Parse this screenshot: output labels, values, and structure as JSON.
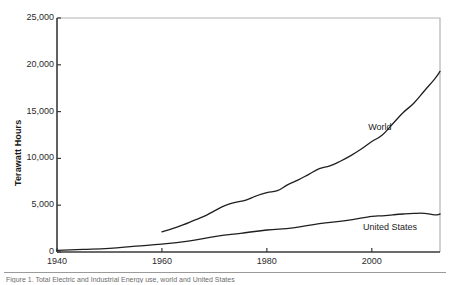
{
  "chart_data": {
    "type": "line",
    "title": "",
    "xlabel": "",
    "ylabel": "Terawatt Hours",
    "xlim": [
      1940,
      2013
    ],
    "ylim": [
      0,
      25000
    ],
    "grid": false,
    "legend_position": "inline-annotation",
    "xticks": [
      1940,
      1960,
      1980,
      2000
    ],
    "xtick_labels": [
      "1940",
      "1960",
      "1980",
      "2000"
    ],
    "yticks": [
      0,
      5000,
      10000,
      15000,
      20000,
      25000
    ],
    "ytick_labels": [
      "0",
      "5,000",
      "10,000",
      "15,000",
      "20,000",
      "25,000"
    ],
    "series": [
      {
        "name": "World",
        "color": "#1f1f1f",
        "label_x": 2002,
        "label_y": 13200,
        "x": [
          1960,
          1962,
          1964,
          1966,
          1968,
          1970,
          1972,
          1974,
          1976,
          1978,
          1980,
          1982,
          1984,
          1986,
          1988,
          1990,
          1992,
          1994,
          1996,
          1998,
          2000,
          2002,
          2004,
          2006,
          2008,
          2010,
          2012,
          2013
        ],
        "values": [
          2150,
          2500,
          2900,
          3350,
          3800,
          4400,
          4950,
          5300,
          5550,
          6000,
          6350,
          6550,
          7200,
          7700,
          8300,
          8900,
          9200,
          9700,
          10300,
          11000,
          11800,
          12500,
          13700,
          14900,
          15900,
          17200,
          18500,
          19300
        ]
      },
      {
        "name": "United States",
        "color": "#1f1f1f",
        "label_x": 2001,
        "label_y": 2600,
        "x": [
          1940,
          1945,
          1950,
          1955,
          1960,
          1965,
          1970,
          1975,
          1980,
          1985,
          1990,
          1995,
          2000,
          2002,
          2004,
          2006,
          2008,
          2010,
          2012,
          2013
        ],
        "values": [
          180,
          270,
          390,
          630,
          840,
          1160,
          1640,
          2000,
          2350,
          2570,
          3040,
          3350,
          3800,
          3860,
          3970,
          4060,
          4120,
          4130,
          3970,
          4060
        ]
      }
    ]
  },
  "caption": {
    "text": "Figure 1. Total Electric and Industrial Energy use, world and United States"
  },
  "figure": {
    "plot_left": 57,
    "plot_right": 440,
    "plot_top": 18,
    "plot_bottom": 252,
    "frame_color": "#b3b3b3",
    "axis_color": "#3a3a3a",
    "line_color": "#1f1f1f"
  }
}
